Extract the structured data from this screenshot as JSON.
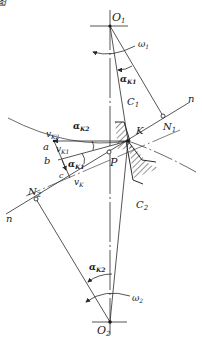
{
  "figure": {
    "title_fragment": "图",
    "points": {
      "O1": {
        "label": "O",
        "sub": "1",
        "x": 110,
        "y": 26
      },
      "O2": {
        "label": "O",
        "sub": "2",
        "x": 110,
        "y": 322
      },
      "P": {
        "label": "P",
        "x": 109,
        "y": 152
      },
      "K": {
        "label": "K",
        "x": 128,
        "y": 141
      },
      "N1": {
        "label": "N",
        "sub": "1",
        "x": 163,
        "y": 116
      },
      "N2": {
        "label": "N",
        "sub": "2",
        "x": 36,
        "y": 199
      },
      "a": {
        "label": "a",
        "x": 50,
        "y": 142
      },
      "b": {
        "label": "b",
        "x": 52,
        "y": 162
      },
      "c": {
        "label": "c",
        "x": 65,
        "y": 176
      }
    },
    "labels": {
      "omega1": {
        "text": "ω",
        "sub": "1"
      },
      "omega2": {
        "text": "ω",
        "sub": "2"
      },
      "alphaK1_top": {
        "text": "α",
        "sub": "K1"
      },
      "alphaK2_top": {
        "text": "α",
        "sub": "K2"
      },
      "alphaK1_mid": {
        "text": "α",
        "sub": "K1"
      },
      "alphaK2_bottom": {
        "text": "α",
        "sub": "K2"
      },
      "vK2": {
        "text": "v",
        "sub": "K2"
      },
      "vK1": {
        "text": "v",
        "sub": "K1"
      },
      "vK": {
        "text": "v",
        "sub": "K"
      },
      "C1": {
        "text": "C",
        "sub": "1"
      },
      "C2": {
        "text": "C",
        "sub": "2"
      },
      "n_top": {
        "text": "n"
      },
      "n_bottom": {
        "text": "n"
      }
    },
    "colors": {
      "line": "#2a2a2a",
      "text": "#1a1a1a",
      "background": "#ffffff"
    }
  }
}
